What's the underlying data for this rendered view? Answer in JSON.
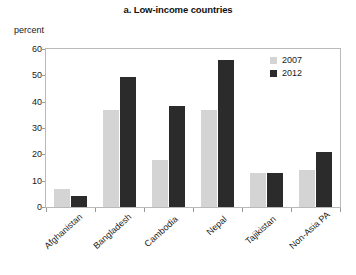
{
  "chart_data": {
    "type": "bar",
    "title": "a. Low-income countries",
    "xlabel": "",
    "ylabel": "percent",
    "ylim": [
      0,
      60
    ],
    "yticks": [
      0,
      10,
      20,
      30,
      40,
      50,
      60
    ],
    "grid": false,
    "legend_position": "top-right-inside",
    "categories": [
      "Afghanistan",
      "Bangladesh",
      "Cambodia",
      "Nepal",
      "Tajikistan",
      "Non-Asia PA"
    ],
    "series": [
      {
        "name": "2007",
        "color": "#d4d4d4",
        "values": [
          7,
          37,
          18,
          37,
          13,
          14
        ]
      },
      {
        "name": "2012",
        "color": "#2b2b2b",
        "values": [
          4,
          49.5,
          38.5,
          56,
          13,
          21
        ]
      }
    ]
  },
  "colors": {
    "series_2007": "#d4d4d4",
    "series_2012": "#2b2b2b",
    "axis": "#b9b9b9",
    "text": "#1a1a1a",
    "background": "#ffffff"
  }
}
